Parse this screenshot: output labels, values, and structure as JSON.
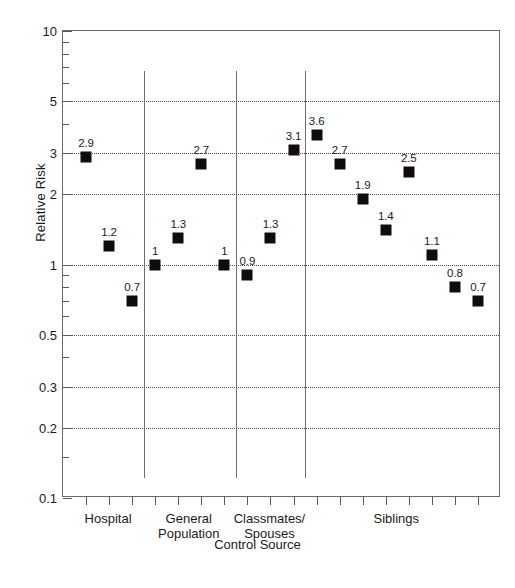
{
  "chart_data": {
    "type": "scatter",
    "title": "",
    "xlabel": "Control Source",
    "ylabel": "Relative Risk",
    "yscale": "log",
    "ylim": [
      0.1,
      10
    ],
    "ytick_labels": [
      "10",
      "5",
      "3",
      "2",
      "1",
      "0.5",
      "0.3",
      "0.2",
      "0.1"
    ],
    "ytick_values": [
      10,
      5,
      3,
      2,
      1,
      0.5,
      0.3,
      0.2,
      0.1
    ],
    "gridlines": [
      5,
      3,
      2,
      1,
      0.5,
      0.3,
      0.2
    ],
    "grid": true,
    "legend": "none",
    "n_xticks": 18,
    "groups": [
      {
        "label": "Hospital",
        "label_lines": [
          "Hospital"
        ],
        "tick_start": 1,
        "points": [
          {
            "tick": 1,
            "value": 2.9,
            "label": "2.9"
          },
          {
            "tick": 2,
            "value": 1.2,
            "label": "1.2"
          },
          {
            "tick": 3,
            "value": 0.7,
            "label": "0.7"
          }
        ]
      },
      {
        "label": "General Population",
        "label_lines": [
          "General",
          "Population"
        ],
        "tick_start": 4,
        "points": [
          {
            "tick": 4,
            "value": 1.0,
            "label": "1"
          },
          {
            "tick": 5,
            "value": 1.3,
            "label": "1.3"
          },
          {
            "tick": 6,
            "value": 2.7,
            "label": "2.7"
          },
          {
            "tick": 7,
            "value": 1.0,
            "label": "1"
          }
        ]
      },
      {
        "label": "Classmates/Spouses",
        "label_lines": [
          "Classmates/",
          "Spouses"
        ],
        "tick_start": 8,
        "points": [
          {
            "tick": 8,
            "value": 0.9,
            "label": "0.9"
          },
          {
            "tick": 9,
            "value": 1.3,
            "label": "1.3"
          },
          {
            "tick": 10,
            "value": 3.1,
            "label": "3.1"
          }
        ]
      },
      {
        "label": "Siblings",
        "label_lines": [
          "Siblings"
        ],
        "tick_start": 11,
        "points": [
          {
            "tick": 11,
            "value": 3.6,
            "label": "3.6"
          },
          {
            "tick": 12,
            "value": 2.7,
            "label": "2.7"
          },
          {
            "tick": 13,
            "value": 1.9,
            "label": "1.9"
          },
          {
            "tick": 14,
            "value": 1.4,
            "label": "1.4"
          },
          {
            "tick": 15,
            "value": 2.5,
            "label": "2.5"
          },
          {
            "tick": 16,
            "value": 1.1,
            "label": "1.1"
          },
          {
            "tick": 17,
            "value": 0.8,
            "label": "0.8"
          },
          {
            "tick": 18,
            "value": 0.7,
            "label": "0.7"
          }
        ]
      }
    ],
    "separators_after_tick": [
      3,
      7,
      10
    ],
    "marker": {
      "shape": "square",
      "color": "#100c0c",
      "size_px": 11
    }
  },
  "axis": {
    "y_title": "Relative Risk",
    "x_title": "Control Source"
  }
}
